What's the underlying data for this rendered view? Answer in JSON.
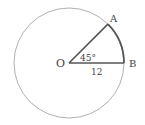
{
  "diagram": {
    "type": "circle-sector",
    "circle": {
      "cx": 69,
      "cy": 63,
      "r": 55,
      "stroke": "#999999"
    },
    "points": {
      "center": {
        "label": "O",
        "x": 69,
        "y": 63
      },
      "A": {
        "label": "A",
        "x": 108,
        "y": 24
      },
      "B": {
        "label": "B",
        "x": 124,
        "y": 63
      }
    },
    "angle_label": "45°",
    "radius_label": "12",
    "sector_color": "#555555"
  }
}
